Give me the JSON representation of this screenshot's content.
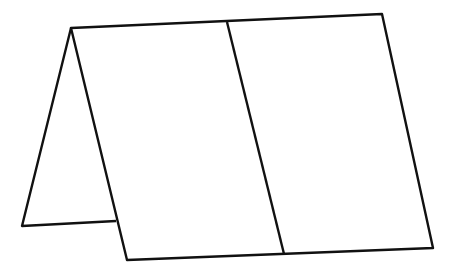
{
  "diagram": {
    "title": "",
    "stroke_color": "#111111",
    "background": "#ffffff",
    "shapes": {
      "front_face": [
        [
          71,
          28
        ],
        [
          382,
          14
        ],
        [
          433,
          248
        ],
        [
          127,
          260
        ]
      ],
      "side_face": [
        [
          71,
          28
        ],
        [
          22,
          226
        ],
        [
          116,
          221
        ]
      ],
      "crease_line": [
        [
          227,
          22
        ],
        [
          284,
          254
        ]
      ]
    }
  }
}
